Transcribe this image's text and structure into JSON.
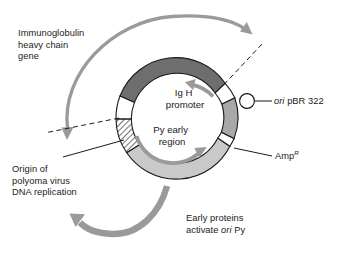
{
  "figure": {
    "type": "plasmid-map-diagram",
    "background_color": "#ffffff",
    "ring": {
      "center_x": 176,
      "center_y": 118,
      "outer_radius": 60,
      "inner_radius": 46
    },
    "colors": {
      "ig_h_gene": "#6e6e6e",
      "py_early_region": "#c9c9c9",
      "amp_r": "#a8a8a8",
      "hatch_line": "#2a2a2a",
      "outline": "#1a1a1a",
      "arrow_gray": "#9a9a9a",
      "arrow_gray_dark": "#8c8c8c",
      "text": "#1a1a1a",
      "gap_white": "#ffffff"
    },
    "segments": [
      {
        "name": "ig-h-gene-segment",
        "label": "Immunoglobulin heavy chain gene",
        "fill": "#6e6e6e",
        "start_angle_deg": 201,
        "end_angle_deg": 325
      },
      {
        "name": "polyoma-origin-segment",
        "label": "Origin of polyoma virus DNA replication",
        "fill": "hatched",
        "start_angle_deg": 183,
        "end_angle_deg": 160
      },
      {
        "name": "py-early-region-segment",
        "label": "Py early region",
        "fill": "#c9c9c9",
        "start_angle_deg": 160,
        "end_angle_deg": 60
      },
      {
        "name": "amp-r-segment",
        "label": "Amp R",
        "fill": "#a8a8a8",
        "start_angle_deg": 53,
        "end_angle_deg": 10
      }
    ]
  },
  "labels": {
    "immunoglobulin": {
      "name": "immunoglobulin-heavy-chain-gene-label",
      "line1": "Immunoglobulin",
      "line2": "heavy chain",
      "line3": "gene"
    },
    "ori_pbr": {
      "name": "ori-pbr322-label",
      "italic_part": "ori",
      "rest": "pBR 322"
    },
    "amp_r": {
      "name": "amp-resistance-label",
      "base": "Amp",
      "superscript": "R"
    },
    "polyoma_origin": {
      "name": "polyoma-origin-label",
      "line1": "Origin of",
      "line2": "polyoma virus",
      "line3": "DNA replication"
    },
    "ig_h_promoter": {
      "name": "ig-h-promoter-label",
      "line1": "Ig H",
      "line2": "promoter"
    },
    "py_early_region": {
      "name": "py-early-region-label",
      "line1": "Py early",
      "line2": "region"
    },
    "early_proteins": {
      "name": "early-proteins-label",
      "line1": "Early proteins",
      "line2_pre": "activate ",
      "line2_italic": "ori",
      "line2_post": " Py"
    }
  }
}
